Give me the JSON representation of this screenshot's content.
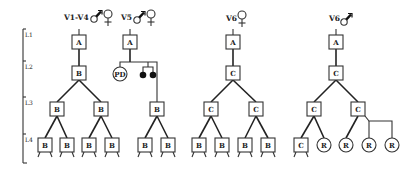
{
  "axis": {
    "levels": [
      {
        "label": "L1",
        "y": 35
      },
      {
        "label": "L2",
        "y": 67
      },
      {
        "label": "L3",
        "y": 103
      },
      {
        "label": "L4",
        "y": 140
      }
    ]
  },
  "trees": [
    {
      "id": "v1-v4",
      "label": "V1-V4",
      "sex_symbols": [
        "male",
        "female"
      ],
      "root": "A",
      "level2": "B",
      "level3": [
        "B",
        "B"
      ],
      "level4": [
        "B",
        "B",
        "B",
        "B"
      ]
    },
    {
      "id": "v5",
      "label": "V5",
      "sex_symbols": [
        "male",
        "female"
      ],
      "root": "A",
      "level2": {
        "circle": "PD",
        "filled_dots": 2
      },
      "level3": [
        "B"
      ],
      "level4": [
        "B",
        "B"
      ]
    },
    {
      "id": "v6-female",
      "label": "V6",
      "sex_symbols": [
        "female"
      ],
      "root": "A",
      "level2": "C",
      "level3": [
        "C",
        "C"
      ],
      "level4": [
        "B",
        "B",
        "B",
        "B"
      ]
    },
    {
      "id": "v6-male",
      "label": "V6",
      "sex_symbols": [
        "male"
      ],
      "root": "A",
      "level2": "C",
      "level3": [
        "C",
        "C"
      ],
      "level4": [
        "C",
        "R",
        "R",
        "R",
        "R"
      ]
    }
  ],
  "legend_icons": {
    "male": "male-symbol-icon",
    "female": "female-symbol-icon"
  },
  "colors": {
    "line": "#222222",
    "box_fill": "#ffffff",
    "dot_fill": "#111111"
  }
}
